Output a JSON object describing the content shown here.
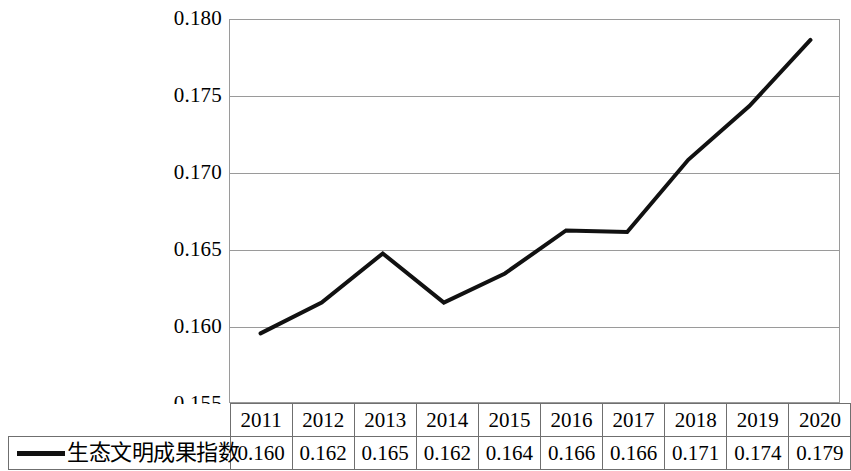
{
  "chart_data": {
    "type": "line",
    "title": "",
    "xlabel": "",
    "ylabel": "",
    "categories": [
      "2011",
      "2012",
      "2013",
      "2014",
      "2015",
      "2016",
      "2017",
      "2018",
      "2019",
      "2020"
    ],
    "series": [
      {
        "name": "生态文明成果指数",
        "values": [
          0.16,
          0.162,
          0.165,
          0.162,
          0.164,
          0.166,
          0.166,
          0.171,
          0.174,
          0.179
        ],
        "plotted_values": [
          0.1596,
          0.1616,
          0.1648,
          0.1616,
          0.1635,
          0.1663,
          0.1662,
          0.1709,
          0.1744,
          0.1787
        ],
        "color": "#111111",
        "line_width": 4
      }
    ],
    "ylim": [
      0.155,
      0.18
    ],
    "yticks": [
      0.155,
      0.16,
      0.165,
      0.17,
      0.175,
      0.18
    ],
    "ytick_labels": [
      "0.155",
      "0.160",
      "0.165",
      "0.170",
      "0.175",
      "0.180"
    ],
    "grid": true,
    "grid_axis": "y",
    "legend_position": "bottom-table",
    "has_data_table": true
  },
  "axis": {
    "y_labels": [
      "0.180",
      "0.175",
      "0.170",
      "0.165",
      "0.160",
      "0.155"
    ]
  },
  "table": {
    "legend_label": "生态文明成果指数",
    "years": [
      "2011",
      "2012",
      "2013",
      "2014",
      "2015",
      "2016",
      "2017",
      "2018",
      "2019",
      "2020"
    ],
    "values": [
      "0.160",
      "0.162",
      "0.165",
      "0.162",
      "0.164",
      "0.166",
      "0.166",
      "0.171",
      "0.174",
      "0.179"
    ]
  },
  "colors": {
    "series_line": "#111111",
    "grid": "#9a9a9a",
    "table_border": "#6f6f6f",
    "background": "#ffffff"
  }
}
